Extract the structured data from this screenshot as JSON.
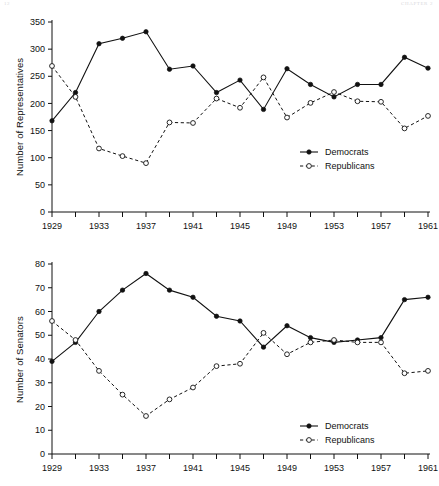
{
  "page": {
    "header_left": "12",
    "header_right": "CHAPTER 2"
  },
  "charts": [
    {
      "id": "representatives",
      "ylabel": "Number of Representatives",
      "legend": {
        "democrats": "Democrats",
        "republicans": "Republicans"
      }
    },
    {
      "id": "senators",
      "ylabel": "Number of Senators",
      "legend": {
        "democrats": "Democrats",
        "republicans": "Republicans"
      }
    }
  ],
  "chart_data": [
    {
      "type": "line",
      "title": "",
      "xlabel": "",
      "ylabel": "Number of Representatives",
      "x": [
        1929,
        1931,
        1933,
        1935,
        1937,
        1939,
        1941,
        1943,
        1945,
        1947,
        1949,
        1951,
        1953,
        1955,
        1957,
        1959,
        1961
      ],
      "xtick_labels": [
        "1929",
        "1933",
        "1937",
        "1941",
        "1945",
        "1949",
        "1953",
        "1957",
        "1961"
      ],
      "xtick_values": [
        1929,
        1933,
        1937,
        1941,
        1945,
        1949,
        1953,
        1957,
        1961
      ],
      "xlim": [
        1929,
        1961
      ],
      "ylim": [
        0,
        350
      ],
      "ytick_values": [
        0,
        50,
        100,
        150,
        200,
        250,
        300,
        350
      ],
      "ytick_labels": [
        "0",
        "50",
        "100",
        "150",
        "200",
        "250",
        "300",
        "350"
      ],
      "grid": false,
      "legend_position": "lower-right",
      "series": [
        {
          "name": "Democrats",
          "marker": "filled-circle",
          "linestyle": "solid",
          "color": "#111111",
          "values": [
            168,
            220,
            310,
            320,
            332,
            263,
            269,
            220,
            243,
            189,
            264,
            235,
            212,
            235,
            235,
            285,
            265
          ]
        },
        {
          "name": "Republicans",
          "marker": "open-circle",
          "linestyle": "dashed",
          "color": "#111111",
          "values": [
            269,
            212,
            117,
            103,
            90,
            165,
            164,
            209,
            192,
            248,
            174,
            201,
            221,
            204,
            203,
            154,
            177
          ]
        }
      ]
    },
    {
      "type": "line",
      "title": "",
      "xlabel": "",
      "ylabel": "Number of Senators",
      "x": [
        1929,
        1931,
        1933,
        1935,
        1937,
        1939,
        1941,
        1943,
        1945,
        1947,
        1949,
        1951,
        1953,
        1955,
        1957,
        1959,
        1961
      ],
      "xtick_labels": [
        "1929",
        "1933",
        "1937",
        "1941",
        "1945",
        "1949",
        "1953",
        "1957",
        "1961"
      ],
      "xtick_values": [
        1929,
        1933,
        1937,
        1941,
        1945,
        1949,
        1953,
        1957,
        1961
      ],
      "xlim": [
        1929,
        1961
      ],
      "ylim": [
        0,
        80
      ],
      "ytick_values": [
        0,
        10,
        20,
        30,
        40,
        50,
        60,
        70,
        80
      ],
      "ytick_labels": [
        "0",
        "10",
        "20",
        "30",
        "40",
        "50",
        "60",
        "70",
        "80"
      ],
      "grid": false,
      "legend_position": "lower-right",
      "series": [
        {
          "name": "Democrats",
          "marker": "filled-circle",
          "linestyle": "solid",
          "color": "#111111",
          "values": [
            39,
            47,
            60,
            69,
            76,
            69,
            66,
            58,
            56,
            45,
            54,
            49,
            47,
            48,
            49,
            65,
            66
          ]
        },
        {
          "name": "Republicans",
          "marker": "open-circle",
          "linestyle": "dashed",
          "color": "#111111",
          "values": [
            56,
            48,
            35,
            25,
            16,
            23,
            28,
            37,
            38,
            51,
            42,
            47,
            48,
            47,
            47,
            34,
            35
          ]
        }
      ]
    }
  ]
}
